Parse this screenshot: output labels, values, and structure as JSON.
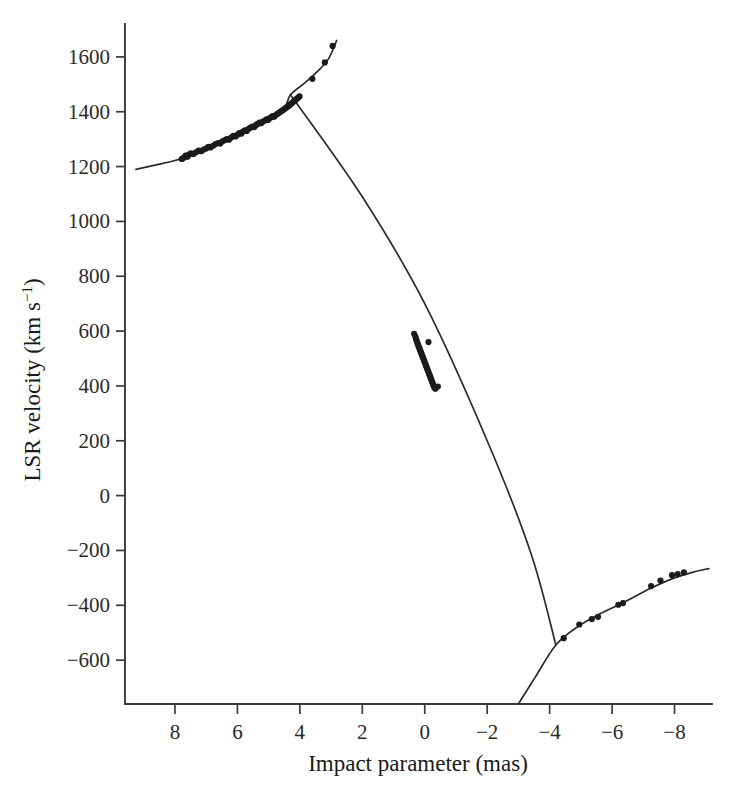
{
  "chart_data": {
    "type": "scatter",
    "title": "",
    "subtitle": "",
    "xlabel": "Impact parameter (mas)",
    "ylabel": "LSR velocity (km s⁻¹)",
    "xlim": [
      9.6,
      -9.2
    ],
    "ylim": [
      -760,
      1720
    ],
    "x_ticks": [
      8,
      6,
      4,
      2,
      0,
      -2,
      -4,
      -6,
      -8
    ],
    "x_tick_labels": [
      "8",
      "6",
      "4",
      "2",
      "0",
      "−2",
      "−4",
      "−6",
      "−8"
    ],
    "y_ticks": [
      1600,
      1400,
      1200,
      1000,
      800,
      600,
      400,
      200,
      0,
      -200,
      -400,
      -600
    ],
    "y_tick_labels": [
      "1600",
      "1400",
      "1200",
      "1000",
      "800",
      "600",
      "400",
      "200",
      "0",
      "−200",
      "−400",
      "−600"
    ],
    "x_axis_direction": "reversed",
    "grid": false,
    "legend": false,
    "legend_position": "none",
    "axis_style": "left-and-bottom-spines",
    "marker": "filled-circle",
    "marker_color": "#1b1b1b",
    "curve_color": "#2b2b2b",
    "background_color": "#ffffff",
    "annotations": [],
    "series": [
      {
        "name": "Red-shifted high-velocity maser cluster",
        "description": "Dense clump of maser spots on the upper-left rising branch",
        "points": [
          [
            7.78,
            1228
          ],
          [
            7.72,
            1232
          ],
          [
            7.66,
            1240
          ],
          [
            7.6,
            1236
          ],
          [
            7.55,
            1244
          ],
          [
            7.49,
            1248
          ],
          [
            7.41,
            1246
          ],
          [
            7.33,
            1252
          ],
          [
            7.24,
            1258
          ],
          [
            7.16,
            1256
          ],
          [
            7.08,
            1262
          ],
          [
            7.0,
            1266
          ],
          [
            6.93,
            1272
          ],
          [
            6.86,
            1270
          ],
          [
            6.78,
            1276
          ],
          [
            6.7,
            1282
          ],
          [
            6.62,
            1286
          ],
          [
            6.55,
            1284
          ],
          [
            6.48,
            1292
          ],
          [
            6.41,
            1296
          ],
          [
            6.34,
            1300
          ],
          [
            6.27,
            1298
          ],
          [
            6.2,
            1306
          ],
          [
            6.13,
            1312
          ],
          [
            6.06,
            1310
          ],
          [
            6.0,
            1316
          ],
          [
            5.94,
            1322
          ],
          [
            5.88,
            1320
          ],
          [
            5.82,
            1328
          ],
          [
            5.76,
            1332
          ],
          [
            5.7,
            1330
          ],
          [
            5.64,
            1338
          ],
          [
            5.58,
            1342
          ],
          [
            5.52,
            1346
          ],
          [
            5.46,
            1344
          ],
          [
            5.4,
            1352
          ],
          [
            5.35,
            1356
          ],
          [
            5.29,
            1360
          ],
          [
            5.24,
            1358
          ],
          [
            5.18,
            1364
          ],
          [
            5.12,
            1368
          ],
          [
            5.07,
            1372
          ],
          [
            5.02,
            1370
          ],
          [
            4.97,
            1376
          ],
          [
            4.92,
            1380
          ],
          [
            4.87,
            1384
          ],
          [
            4.82,
            1382
          ],
          [
            4.77,
            1388
          ],
          [
            4.72,
            1392
          ],
          [
            4.67,
            1396
          ],
          [
            4.62,
            1400
          ],
          [
            4.57,
            1404
          ],
          [
            4.52,
            1408
          ],
          [
            4.47,
            1412
          ],
          [
            4.42,
            1416
          ],
          [
            4.37,
            1420
          ],
          [
            4.33,
            1424
          ],
          [
            4.29,
            1428
          ],
          [
            4.25,
            1432
          ],
          [
            4.21,
            1436
          ],
          [
            4.17,
            1440
          ],
          [
            4.13,
            1444
          ],
          [
            4.09,
            1448
          ],
          [
            4.05,
            1452
          ],
          [
            4.01,
            1456
          ],
          [
            3.6,
            1520
          ],
          [
            3.2,
            1580
          ],
          [
            2.95,
            1640
          ]
        ]
      },
      {
        "name": "Systemic low-velocity maser cluster",
        "description": "Spots near zero impact parameter on the steep inner line",
        "points": [
          [
            0.3,
            580
          ],
          [
            0.28,
            572
          ],
          [
            0.26,
            565
          ],
          [
            0.24,
            558
          ],
          [
            0.22,
            552
          ],
          [
            0.2,
            545
          ],
          [
            0.18,
            540
          ],
          [
            0.16,
            534
          ],
          [
            0.14,
            528
          ],
          [
            0.12,
            522
          ],
          [
            0.1,
            516
          ],
          [
            0.08,
            510
          ],
          [
            0.06,
            504
          ],
          [
            0.04,
            498
          ],
          [
            0.02,
            492
          ],
          [
            0.0,
            486
          ],
          [
            -0.02,
            480
          ],
          [
            -0.04,
            474
          ],
          [
            -0.06,
            468
          ],
          [
            -0.08,
            462
          ],
          [
            -0.1,
            456
          ],
          [
            -0.12,
            450
          ],
          [
            -0.14,
            444
          ],
          [
            -0.16,
            438
          ],
          [
            -0.18,
            432
          ],
          [
            -0.2,
            426
          ],
          [
            -0.22,
            420
          ],
          [
            -0.24,
            414
          ],
          [
            -0.26,
            408
          ],
          [
            -0.28,
            402
          ],
          [
            -0.3,
            396
          ],
          [
            -0.34,
            390
          ],
          [
            0.34,
            590
          ],
          [
            -0.42,
            398
          ],
          [
            -0.12,
            560
          ]
        ]
      },
      {
        "name": "Blue-shifted high-velocity maser cluster",
        "description": "Sparse spots on the lower-right branch",
        "points": [
          [
            -4.45,
            -520
          ],
          [
            -4.95,
            -470
          ],
          [
            -5.35,
            -450
          ],
          [
            -5.55,
            -442
          ],
          [
            -6.2,
            -398
          ],
          [
            -6.35,
            -392
          ],
          [
            -7.25,
            -330
          ],
          [
            -7.55,
            -310
          ],
          [
            -7.92,
            -290
          ],
          [
            -8.1,
            -286
          ],
          [
            -8.3,
            -280
          ]
        ]
      }
    ],
    "curves": [
      {
        "name": "Keplerian-rotation red-shifted branch",
        "description": "Upper-left curve rising from the left axis to the upper right",
        "points": [
          [
            9.25,
            1190
          ],
          [
            8.6,
            1206
          ],
          [
            8.0,
            1222
          ],
          [
            7.4,
            1244
          ],
          [
            6.8,
            1270
          ],
          [
            6.2,
            1302
          ],
          [
            5.6,
            1338
          ],
          [
            5.0,
            1378
          ],
          [
            4.5,
            1414
          ],
          [
            4.3,
            1462
          ],
          [
            3.9,
            1500
          ],
          [
            3.5,
            1540
          ],
          [
            3.1,
            1590
          ],
          [
            2.82,
            1660
          ]
        ]
      },
      {
        "name": "Inner rigid-rotation line",
        "description": "Steep nearly straight line crossing the two outer curves",
        "points": [
          [
            4.3,
            1462
          ],
          [
            2.0,
            1090
          ],
          [
            0.0,
            700
          ],
          [
            -2.0,
            200
          ],
          [
            -3.4,
            -210
          ],
          [
            -4.2,
            -545
          ]
        ]
      },
      {
        "name": "Keplerian-rotation blue-shifted branch",
        "description": "Lower-right curve rising from the bottom axis toward the right",
        "points": [
          [
            -3.0,
            -760
          ],
          [
            -3.55,
            -660
          ],
          [
            -4.2,
            -545
          ],
          [
            -4.9,
            -478
          ],
          [
            -5.6,
            -432
          ],
          [
            -6.4,
            -388
          ],
          [
            -7.2,
            -340
          ],
          [
            -8.0,
            -300
          ],
          [
            -8.7,
            -276
          ],
          [
            -9.1,
            -266
          ]
        ]
      }
    ]
  },
  "axes": {
    "x": {
      "title": "Impact parameter (mas)",
      "labels": [
        "8",
        "6",
        "4",
        "2",
        "0",
        "−2",
        "−4",
        "−6",
        "−8"
      ]
    },
    "y": {
      "title_main": "LSR velocity (km s",
      "title_exponent": "−1",
      "title_close": ")",
      "title_full": "LSR velocity (km s⁻¹)",
      "labels": [
        "1600",
        "1400",
        "1200",
        "1000",
        "800",
        "600",
        "400",
        "200",
        "0",
        "−200",
        "−400",
        "−600"
      ]
    }
  }
}
